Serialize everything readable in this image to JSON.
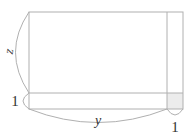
{
  "diagram": {
    "labels": {
      "left_height": "z",
      "left_strip": "1",
      "bottom_width": "y",
      "bottom_strip": "1"
    },
    "colors": {
      "stroke": "#b0b0b0",
      "corner_fill": "#ececec",
      "text": "#333333"
    }
  }
}
